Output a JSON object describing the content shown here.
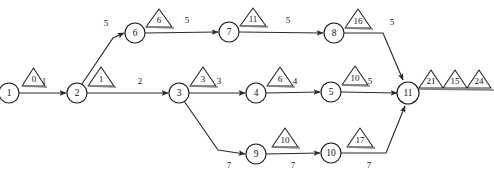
{
  "diagram": {
    "type": "activity-network-diagram",
    "title": "",
    "width": 494,
    "height": 176,
    "colors": {
      "background": "#ffffff",
      "stroke": "#1c1c1c",
      "edge": "#2a2a2a",
      "triangle_stroke": "#262626",
      "text": "#111111",
      "baseline": "#7d7d7d"
    },
    "nodes": [
      {
        "id": "n1",
        "label": "1",
        "x": 9,
        "y": 92
      },
      {
        "id": "n2",
        "label": "2",
        "x": 77,
        "y": 92
      },
      {
        "id": "n3",
        "label": "3",
        "x": 179,
        "y": 92
      },
      {
        "id": "n4",
        "label": "4",
        "x": 256,
        "y": 92
      },
      {
        "id": "n5",
        "label": "5",
        "x": 331,
        "y": 91
      },
      {
        "id": "n6",
        "label": "6",
        "x": 135,
        "y": 32
      },
      {
        "id": "n7",
        "label": "7",
        "x": 229,
        "y": 31
      },
      {
        "id": "n8",
        "label": "8",
        "x": 334,
        "y": 33
      },
      {
        "id": "n9",
        "label": "9",
        "x": 256,
        "y": 153
      },
      {
        "id": "n10",
        "label": "10",
        "x": 331,
        "y": 152
      },
      {
        "id": "n11",
        "label": "11",
        "x": 408,
        "y": 93
      }
    ],
    "edges": [
      {
        "from": "n1",
        "to": "n2",
        "weight": "1"
      },
      {
        "from": "n2",
        "to": "n6",
        "weight": "5"
      },
      {
        "from": "n2",
        "to": "n3",
        "weight": "2"
      },
      {
        "from": "n6",
        "to": "n7",
        "weight": "5"
      },
      {
        "from": "n7",
        "to": "n8",
        "weight": "5"
      },
      {
        "from": "n8",
        "to": "n11",
        "weight": "5"
      },
      {
        "from": "n3",
        "to": "n4",
        "weight": "3"
      },
      {
        "from": "n4",
        "to": "n5",
        "weight": "4"
      },
      {
        "from": "n5",
        "to": "n11",
        "weight": "5"
      },
      {
        "from": "n3",
        "to": "n9",
        "weight": "7"
      },
      {
        "from": "n9",
        "to": "n10",
        "weight": "7"
      },
      {
        "from": "n10",
        "to": "n11",
        "weight": "7"
      }
    ],
    "triangles": [
      {
        "id": "t1",
        "node": "n1",
        "label": "0"
      },
      {
        "id": "t2",
        "node": "n2",
        "label": "1"
      },
      {
        "id": "t3",
        "node": "n3",
        "label": "3"
      },
      {
        "id": "t4",
        "node": "n4",
        "label": "6"
      },
      {
        "id": "t5",
        "node": "n5",
        "label": "10"
      },
      {
        "id": "t6",
        "node": "n6",
        "label": "6"
      },
      {
        "id": "t7",
        "node": "n7",
        "label": "11"
      },
      {
        "id": "t8",
        "node": "n8",
        "label": "16"
      },
      {
        "id": "t9",
        "node": "n9",
        "label": "10"
      },
      {
        "id": "t10",
        "node": "n10",
        "label": "17"
      },
      {
        "id": "t11",
        "node": "n11",
        "label": "21"
      },
      {
        "id": "t12",
        "node": "n11",
        "label": "15"
      },
      {
        "id": "t13",
        "node": "n11",
        "label": "24"
      }
    ]
  }
}
